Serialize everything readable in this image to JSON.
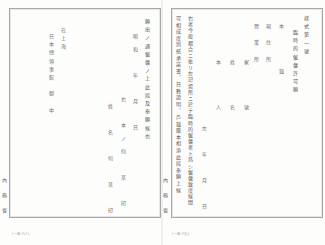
{
  "document": {
    "left_page": {
      "columns": [
        {
          "id": "statement",
          "text": "願出ノ通僱傭ノ上此段及奉願候也"
        },
        {
          "id": "date",
          "text": "昭和　年　月　日"
        },
        {
          "id": "employer",
          "text": "右　本ノ何　某　印"
        },
        {
          "id": "employee",
          "text": "姓　名　何　某　印"
        },
        {
          "id": "place",
          "text": "在上海"
        },
        {
          "id": "addressee",
          "text": "日本總領事館　御　中"
        }
      ],
      "margin_label": "內務省",
      "folio": "(一五八八)"
    },
    "right_page": {
      "columns": [
        {
          "id": "form_number",
          "text": "様式第一號"
        },
        {
          "id": "form_title",
          "text": "臨時的僱傭許可願"
        },
        {
          "id": "honseki",
          "text": "本　　籍"
        },
        {
          "id": "genjusho",
          "text": "現　住　所"
        },
        {
          "id": "eigyosho",
          "text": "營　業　所"
        },
        {
          "id": "yago",
          "text": "家　　號"
        },
        {
          "id": "seimei",
          "text": "姓　　名"
        },
        {
          "id": "honnin",
          "text": "本　　人"
        },
        {
          "id": "body_1",
          "text": "右者今般都合ニ依リ左記場所ニ於テ臨時的僱傭者ト爲シ僱傭致度候間"
        },
        {
          "id": "body_2",
          "text": "可相成度別紙承諾書、日數證明、戶籍謄本相添此段奉願上候"
        },
        {
          "id": "date",
          "text": "左　年　月　日"
        }
      ],
      "margin_label": "內務省",
      "folio": "(一五八九)"
    }
  }
}
